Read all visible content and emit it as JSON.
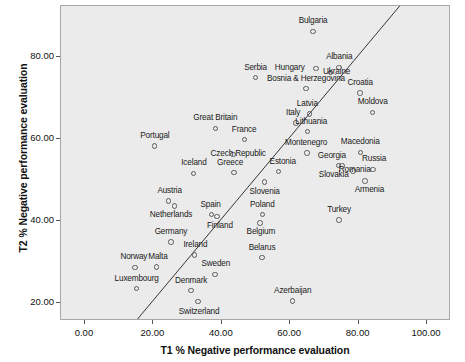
{
  "chart_data": {
    "type": "scatter",
    "title": "",
    "xlabel": "T1 % Negative performance evaluation",
    "ylabel": "T2 % Negative performance evaluation",
    "xlim": [
      -7,
      107
    ],
    "ylim": [
      15.5,
      92.5
    ],
    "xticks": [
      0.0,
      20.0,
      40.0,
      60.0,
      80.0,
      100.0
    ],
    "xtick_labels": [
      "0.00",
      "20.00",
      "40.00",
      "60.00",
      "80.00",
      "100.00"
    ],
    "yticks": [
      20.0,
      40.0,
      60.0,
      80.0
    ],
    "ytick_labels": [
      "20.00",
      "40.00",
      "60.00",
      "80.00"
    ],
    "grid": false,
    "legend": "none",
    "reference_line": {
      "type": "identity",
      "label": "y = x",
      "from": [
        -6,
        -6
      ],
      "to": [
        106,
        106
      ]
    },
    "marker": {
      "shape": "open-circle",
      "edge_color": "#5a5a5a",
      "fill": "none"
    },
    "plot_background": "#ebebeb",
    "points": [
      {
        "label": "Bulgaria",
        "x": 66.7,
        "y": 86.3,
        "label_dx": 0,
        "label_dy": -10
      },
      {
        "label": "Albania",
        "x": 74.3,
        "y": 77.5,
        "label_dx": 0,
        "label_dy": -10
      },
      {
        "label": "Hungary",
        "x": 67.5,
        "y": 77.2,
        "label_dx": -26,
        "label_dy": -1
      },
      {
        "label": "Serbia",
        "x": 49.9,
        "y": 75.0,
        "label_dx": 0,
        "label_dy": -10
      },
      {
        "label": "Ukraine",
        "x": 71.8,
        "y": 76.2,
        "label_dx": 6,
        "label_dy": -1
      },
      {
        "label": "Bosnia & Herzegovina",
        "x": 64.6,
        "y": 72.3,
        "label_dx": 0,
        "label_dy": -10
      },
      {
        "label": "Croatia",
        "x": 80.4,
        "y": 71.2,
        "label_dx": 0,
        "label_dy": -10
      },
      {
        "label": "Moldova",
        "x": 84.1,
        "y": 66.5,
        "label_dx": 0,
        "label_dy": -10
      },
      {
        "label": "Latvia",
        "x": 65.6,
        "y": 66.1,
        "label_dx": -2,
        "label_dy": -10
      },
      {
        "label": "Italy",
        "x": 61.7,
        "y": 63.9,
        "label_dx": -3,
        "label_dy": -10
      },
      {
        "label": "Great Britain",
        "x": 38.1,
        "y": 62.6,
        "label_dx": 0,
        "label_dy": -10
      },
      {
        "label": "Lithuania",
        "x": 65.0,
        "y": 61.8,
        "label_dx": 4,
        "label_dy": -10
      },
      {
        "label": "France",
        "x": 46.6,
        "y": 59.8,
        "label_dx": 0,
        "label_dy": -10
      },
      {
        "label": "Portugal",
        "x": 20.4,
        "y": 58.3,
        "label_dx": 0,
        "label_dy": -10
      },
      {
        "label": "Montenegro",
        "x": 64.9,
        "y": 56.6,
        "label_dx": -1,
        "label_dy": -10
      },
      {
        "label": "Macedonia",
        "x": 80.5,
        "y": 56.7,
        "label_dx": 0,
        "label_dy": -10
      },
      {
        "label": "Czech Republic",
        "x": 43.3,
        "y": 56.2,
        "label_dx": 5,
        "label_dy": -1
      },
      {
        "label": "Georgia",
        "x": 74.2,
        "y": 53.5,
        "label_dx": -7,
        "label_dy": -10
      },
      {
        "label": "Russia",
        "x": 84.2,
        "y": 52.6,
        "label_dx": 1,
        "label_dy": -10
      },
      {
        "label": "Iceland",
        "x": 31.8,
        "y": 51.6,
        "label_dx": 0,
        "label_dy": -10
      },
      {
        "label": "Estonia",
        "x": 56.6,
        "y": 52.0,
        "label_dx": 4,
        "label_dy": -10
      },
      {
        "label": "Greece",
        "x": 43.6,
        "y": 51.8,
        "label_dx": -4,
        "label_dy": -10
      },
      {
        "label": "Romania",
        "x": 78.3,
        "y": 52.2,
        "label_dx": 2,
        "label_dy": -1
      },
      {
        "label": "Slovakia",
        "x": 75.1,
        "y": 53.4,
        "label_dx": -8,
        "label_dy": 9
      },
      {
        "label": "Slovenia",
        "x": 52.5,
        "y": 49.5,
        "label_dx": 0,
        "label_dy": 10
      },
      {
        "label": "Armenia",
        "x": 81.9,
        "y": 49.7,
        "label_dx": 4,
        "label_dy": 9
      },
      {
        "label": "Austria",
        "x": 24.4,
        "y": 44.8,
        "label_dx": 1,
        "label_dy": -10
      },
      {
        "label": "Netherlands",
        "x": 26.1,
        "y": 43.6,
        "label_dx": -3,
        "label_dy": 9
      },
      {
        "label": "Spain",
        "x": 37.0,
        "y": 41.5,
        "label_dx": -1,
        "label_dy": -10
      },
      {
        "label": "Poland",
        "x": 51.9,
        "y": 41.5,
        "label_dx": 0,
        "label_dy": -10
      },
      {
        "label": "Finland",
        "x": 38.6,
        "y": 41.0,
        "label_dx": 3,
        "label_dy": 9
      },
      {
        "label": "Turkey",
        "x": 74.3,
        "y": 40.2,
        "label_dx": 0,
        "label_dy": -10
      },
      {
        "label": "Belgium",
        "x": 51.2,
        "y": 39.5,
        "label_dx": 1,
        "label_dy": 9
      },
      {
        "label": "Germany",
        "x": 25.2,
        "y": 34.8,
        "label_dx": 0,
        "label_dy": -10
      },
      {
        "label": "Ireland",
        "x": 32.0,
        "y": 31.6,
        "label_dx": 1,
        "label_dy": -10
      },
      {
        "label": "Belarus",
        "x": 51.8,
        "y": 31.0,
        "label_dx": 0,
        "label_dy": -10
      },
      {
        "label": "Norway",
        "x": 14.6,
        "y": 28.6,
        "label_dx": -1,
        "label_dy": -10
      },
      {
        "label": "Malta",
        "x": 21.0,
        "y": 28.7,
        "label_dx": 1,
        "label_dy": -10
      },
      {
        "label": "Sweden",
        "x": 38.0,
        "y": 26.9,
        "label_dx": 1,
        "label_dy": -10
      },
      {
        "label": "Luxembourg",
        "x": 15.1,
        "y": 23.4,
        "label_dx": 0,
        "label_dy": -10
      },
      {
        "label": "Denmark",
        "x": 31.0,
        "y": 22.9,
        "label_dx": 0,
        "label_dy": -10
      },
      {
        "label": "Azerbaijan",
        "x": 60.7,
        "y": 20.4,
        "label_dx": 0,
        "label_dy": -10
      },
      {
        "label": "Switzerland",
        "x": 33.1,
        "y": 20.2,
        "label_dx": 1,
        "label_dy": 10
      }
    ]
  }
}
